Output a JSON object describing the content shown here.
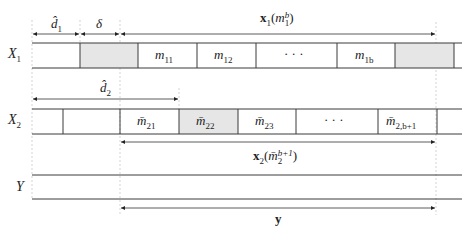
{
  "diagram": {
    "rows": [
      {
        "name": "X",
        "subscript": "1",
        "cells": [
          {
            "text": "",
            "shaded": false
          },
          {
            "text": "",
            "shaded": true
          },
          {
            "text": "m",
            "sub": "11",
            "shaded": false
          },
          {
            "text": "m",
            "sub": "12",
            "shaded": false
          },
          {
            "text": "· · ·",
            "shaded": false
          },
          {
            "text": "m",
            "sub": "1b",
            "shaded": false
          },
          {
            "text": "",
            "shaded": true
          }
        ]
      },
      {
        "name": "X",
        "subscript": "2",
        "cells": [
          {
            "text": "",
            "shaded": false
          },
          {
            "text": "",
            "shaded": false
          },
          {
            "text": "m̄",
            "sub": "21",
            "shaded": false
          },
          {
            "text": "m̄",
            "sub": "22",
            "shaded": true
          },
          {
            "text": "m̄",
            "sub": "23",
            "shaded": false
          },
          {
            "text": "· · ·",
            "shaded": false
          },
          {
            "text": "m̄",
            "sub": "2,b+1",
            "shaded": false
          }
        ]
      },
      {
        "name": "Y",
        "subscript": "",
        "cells": []
      }
    ],
    "spans": {
      "d1": {
        "base": "d̂",
        "sub": "1"
      },
      "delta": {
        "base": "δ"
      },
      "x1": {
        "bold": "x",
        "bold_sub": "1",
        "arg": "m",
        "arg_sub": "1",
        "arg_sup": "b"
      },
      "d2": {
        "base": "d̂",
        "sub": "2"
      },
      "x2": {
        "bold": "x",
        "bold_sub": "2",
        "arg": "m̄",
        "arg_sub": "2",
        "arg_sup": "b+1"
      },
      "y": {
        "bold": "y"
      }
    }
  }
}
